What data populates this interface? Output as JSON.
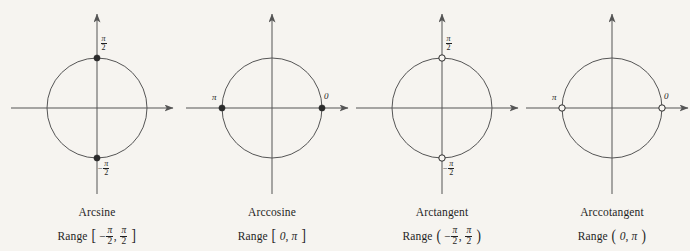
{
  "figure": {
    "background_color": "#f6f4f0",
    "stroke_color": "#555555",
    "marker_color": "#2b2b2b",
    "width": 690,
    "height": 251
  },
  "chart_data": {
    "type": "diagram",
    "title": "",
    "subtitle": "",
    "panels": [
      {
        "id": "arcsine",
        "name": "Arcsine",
        "range_text": "Range [-π/2, π/2]",
        "range_open_bracket": "[",
        "range_close_bracket": "]",
        "range_lower": "-π/2",
        "range_upper": "π/2",
        "range_lower_sign": "−",
        "endpoints_included": true,
        "marker_style": "filled",
        "markers": [
          {
            "position": "top",
            "angle_deg": 90,
            "label": "π/2",
            "label_numerator": "π",
            "label_denominator": "2",
            "label_sign": "",
            "filled": true
          },
          {
            "position": "bottom",
            "angle_deg": -90,
            "label": "-π/2",
            "label_numerator": "π",
            "label_denominator": "2",
            "label_sign": "−",
            "filled": true
          }
        ],
        "center_x": 97,
        "center_y": 108,
        "radius": 50
      },
      {
        "id": "arccosine",
        "name": "Arccosine",
        "range_text": "Range [0, π]",
        "range_open_bracket": "[",
        "range_close_bracket": "]",
        "range_lower": "0",
        "range_upper": "π",
        "range_lower_sign": "",
        "endpoints_included": true,
        "marker_style": "filled",
        "markers": [
          {
            "position": "left",
            "angle_deg": 180,
            "label": "π",
            "label_numerator": "",
            "label_denominator": "",
            "label_sign": "",
            "filled": true
          },
          {
            "position": "right",
            "angle_deg": 0,
            "label": "0",
            "label_numerator": "",
            "label_denominator": "",
            "label_sign": "",
            "filled": true
          }
        ],
        "center_x": 272,
        "center_y": 108,
        "radius": 50
      },
      {
        "id": "arctangent",
        "name": "Arctangent",
        "range_text": "Range (-π/2, π/2)",
        "range_open_bracket": "(",
        "range_close_bracket": ")",
        "range_lower": "-π/2",
        "range_upper": "π/2",
        "range_lower_sign": "−",
        "endpoints_included": false,
        "marker_style": "open",
        "markers": [
          {
            "position": "top",
            "angle_deg": 90,
            "label": "π/2",
            "label_numerator": "π",
            "label_denominator": "2",
            "label_sign": "",
            "filled": false
          },
          {
            "position": "bottom",
            "angle_deg": -90,
            "label": "-π/2",
            "label_numerator": "π",
            "label_denominator": "2",
            "label_sign": "−",
            "filled": false
          }
        ],
        "center_x": 442,
        "center_y": 108,
        "radius": 50
      },
      {
        "id": "arccotangent",
        "name": "Arccotangent",
        "range_text": "Range (0, π)",
        "range_open_bracket": "(",
        "range_close_bracket": ")",
        "range_lower": "0",
        "range_upper": "π",
        "range_lower_sign": "",
        "endpoints_included": false,
        "marker_style": "open",
        "markers": [
          {
            "position": "left",
            "angle_deg": 180,
            "label": "π",
            "label_numerator": "",
            "label_denominator": "",
            "label_sign": "",
            "filled": false
          },
          {
            "position": "right",
            "angle_deg": 0,
            "label": "0",
            "label_numerator": "",
            "label_denominator": "",
            "label_sign": "",
            "filled": false
          }
        ],
        "center_x": 612,
        "center_y": 108,
        "radius": 50
      }
    ]
  },
  "labels": {
    "range_word": "Range",
    "pi": "π",
    "two": "2",
    "zero": "0",
    "minus": "−",
    "comma": ",",
    "bracket_square_open": "[",
    "bracket_square_close": "]",
    "bracket_round_open": "(",
    "bracket_round_close": ")"
  }
}
